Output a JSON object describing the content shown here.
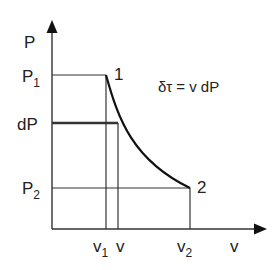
{
  "diagram": {
    "type": "P-v diagram",
    "axes": {
      "y_label": "P",
      "x_label": "v"
    },
    "pressure_labels": {
      "p1": "P",
      "p1_sub": "1",
      "dp": "dP",
      "p2": "P",
      "p2_sub": "2"
    },
    "volume_labels": {
      "v1": "v",
      "v1_sub": "1",
      "v": "v",
      "v2": "v",
      "v2_sub": "2"
    },
    "points": {
      "point1": "1",
      "point2": "2"
    },
    "equation": "δτ = v dP",
    "colors": {
      "line": "#333333",
      "curve": "#111111",
      "text": "#222222"
    }
  }
}
